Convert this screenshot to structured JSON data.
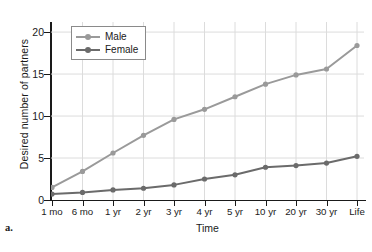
{
  "panel": {
    "letter": "a."
  },
  "chart_data": {
    "type": "line",
    "title": "",
    "xlabel": "Time",
    "ylabel": "Desired number of partners",
    "categories": [
      "1 mo",
      "6 mo",
      "1 yr",
      "2 yr",
      "3 yr",
      "4 yr",
      "5 yr",
      "10 yr",
      "20 yr",
      "30 yr",
      "Life"
    ],
    "series": [
      {
        "name": "Male",
        "color": "#9a9a9a",
        "values": [
          1.5,
          3.4,
          5.6,
          7.7,
          9.6,
          10.8,
          12.3,
          13.8,
          14.9,
          15.6,
          18.4
        ]
      },
      {
        "name": "Female",
        "color": "#6b6b6b",
        "values": [
          0.7,
          0.9,
          1.2,
          1.4,
          1.8,
          2.5,
          3.0,
          3.9,
          4.1,
          4.4,
          5.2
        ]
      }
    ],
    "ylim": [
      0,
      21.2
    ],
    "yticks": [
      0,
      5,
      10,
      15,
      20
    ],
    "ytick_labels": [
      "0",
      "5",
      "10",
      "15",
      "20"
    ],
    "grid": true,
    "grid_color": "#dcdcdc",
    "legend_position": "top-left",
    "axis_color": "#1a1a1a",
    "background": "#ffffff"
  }
}
